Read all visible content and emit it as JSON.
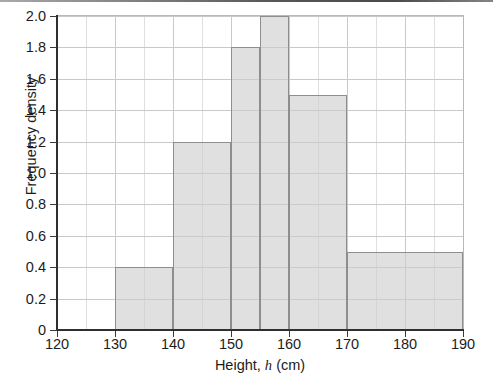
{
  "chart_data": {
    "type": "bar",
    "title": "",
    "subtitle": "",
    "xlabel_parts": {
      "before": "Height, ",
      "variable": "h",
      "after": " (cm)"
    },
    "xlabel": "Height, h (cm)",
    "ylabel": "Frequency density",
    "xlim": [
      120,
      190
    ],
    "ylim": [
      0,
      2.0
    ],
    "grid": true,
    "legend": null,
    "x_major_ticks": [
      120,
      130,
      140,
      150,
      160,
      170,
      180,
      190
    ],
    "x_minor_gridlines": [
      125,
      135,
      145,
      155,
      165,
      175,
      185
    ],
    "x_tick_labels": [
      "120",
      "130",
      "140",
      "150",
      "160",
      "170",
      "180",
      "190"
    ],
    "y_ticks": [
      0,
      0.2,
      0.4,
      0.6,
      0.8,
      1.0,
      1.2,
      1.4,
      1.6,
      1.8,
      2.0
    ],
    "y_tick_labels": [
      "0",
      "0.2",
      "0.4",
      "0.6",
      "0.8",
      "1.0",
      "1.2",
      "1.4",
      "1.6",
      "1.8",
      "2.0"
    ],
    "bars": [
      {
        "label": "130-140",
        "x0": 130,
        "x1": 140,
        "value": 0.4,
        "frequency": 4
      },
      {
        "label": "140-150",
        "x0": 140,
        "x1": 150,
        "value": 1.2,
        "frequency": 12
      },
      {
        "label": "150-155",
        "x0": 150,
        "x1": 155,
        "value": 1.8,
        "frequency": 9
      },
      {
        "label": "155-160",
        "x0": 155,
        "x1": 160,
        "value": 2.0,
        "frequency": 10
      },
      {
        "label": "160-170",
        "x0": 160,
        "x1": 170,
        "value": 1.5,
        "frequency": 15
      },
      {
        "label": "170-190",
        "x0": 170,
        "x1": 190,
        "value": 0.5,
        "frequency": 10
      }
    ],
    "categories": [
      "130-140",
      "140-150",
      "150-155",
      "155-160",
      "160-170",
      "170-190"
    ],
    "values": [
      0.4,
      1.2,
      1.8,
      2.0,
      1.5,
      0.5
    ],
    "colors": {
      "bar_fill": "#cdcdcd",
      "bar_edge": "#8e8e8e",
      "axis": "#2f2f2f",
      "grid_major": "#c9c9c9",
      "grid_minor": "#dfdfdf",
      "text": "#1c1c1c",
      "background": "#ffffff"
    }
  }
}
